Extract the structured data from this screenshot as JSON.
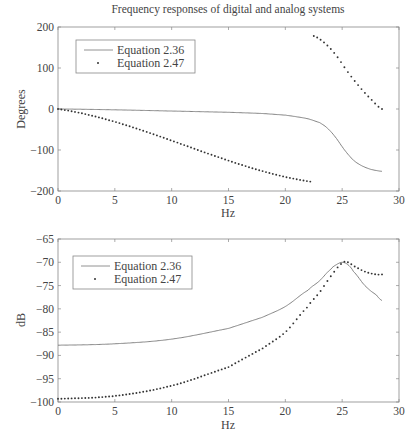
{
  "chart_data": [
    {
      "type": "line",
      "title": "Frequency responses of digital and analog systems",
      "xlabel": "Hz",
      "ylabel": "Degrees",
      "xlim": [
        0,
        30
      ],
      "ylim": [
        -200,
        200
      ],
      "xticks": [
        0,
        5,
        10,
        15,
        20,
        25,
        30
      ],
      "yticks": [
        -200,
        -100,
        0,
        100,
        200
      ],
      "grid": false,
      "legend_position": "upper left",
      "series": [
        {
          "name": "Equation 2.36",
          "style": "solid",
          "x": [
            0,
            5,
            10,
            15,
            18,
            20,
            21,
            22,
            23,
            23.5,
            24,
            24.5,
            25,
            25.5,
            26,
            26.5,
            27,
            27.5,
            28,
            28.5
          ],
          "y": [
            0,
            -2,
            -5,
            -8,
            -11,
            -15,
            -19,
            -24,
            -33,
            -42,
            -55,
            -72,
            -92,
            -110,
            -125,
            -135,
            -142,
            -147,
            -150,
            -152
          ]
        },
        {
          "name": "Equation 2.47",
          "style": "dotted",
          "segments": [
            {
              "x": [
                0,
                22.4
              ],
              "y": [
                0,
                -178
              ]
            },
            {
              "x": [
                22.5,
                23.5,
                24.5,
                25.5,
                26.5,
                27.5,
                28.5
              ],
              "y": [
                178,
                160,
                130,
                90,
                55,
                25,
                0
              ]
            }
          ]
        }
      ]
    },
    {
      "type": "line",
      "title": "",
      "xlabel": "Hz",
      "ylabel": "dB",
      "xlim": [
        0,
        30
      ],
      "ylim": [
        -100,
        -65
      ],
      "xticks": [
        0,
        5,
        10,
        15,
        20,
        25,
        30
      ],
      "yticks": [
        -100,
        -95,
        -90,
        -85,
        -80,
        -75,
        -70,
        -65
      ],
      "grid": false,
      "legend_position": "upper left",
      "series": [
        {
          "name": "Equation 2.36",
          "style": "solid",
          "x": [
            0,
            5,
            10,
            15,
            18,
            20,
            22,
            23,
            24,
            24.5,
            25,
            25.5,
            26,
            27,
            28,
            28.5
          ],
          "y": [
            -87.8,
            -87.5,
            -86.5,
            -84.2,
            -81.8,
            -79.5,
            -76,
            -74,
            -71.5,
            -70.5,
            -70,
            -70.5,
            -72,
            -75,
            -77,
            -78.2
          ]
        },
        {
          "name": "Equation 2.47",
          "style": "dotted",
          "x": [
            0,
            5,
            10,
            15,
            18,
            20,
            22,
            23,
            24,
            25,
            25.5,
            26,
            27,
            28,
            28.5
          ],
          "y": [
            -99.3,
            -98.7,
            -96.5,
            -92.5,
            -88.5,
            -85,
            -79.5,
            -76.5,
            -73,
            -70.2,
            -70,
            -70.8,
            -72,
            -72.6,
            -72.6
          ]
        }
      ]
    }
  ],
  "top": {
    "title": "Frequency responses of digital and analog systems",
    "ylabel": "Degrees",
    "xlabel": "Hz",
    "legend": [
      "Equation 2.36",
      "Equation 2.47"
    ]
  },
  "bottom": {
    "ylabel": "dB",
    "xlabel": "Hz",
    "legend": [
      "Equation 2.36",
      "Equation 2.47"
    ]
  }
}
